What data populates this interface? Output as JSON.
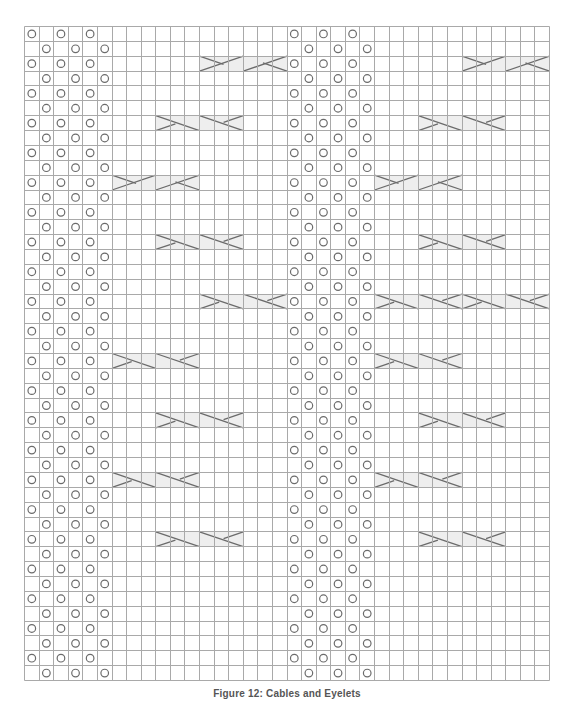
{
  "diagram": {
    "columns": 36,
    "rows": 44,
    "grid_color": "#a9a9a9",
    "symbol_color": "#6b6b6b",
    "cable_fill": "#eeeeee",
    "legend": {
      "eyelet": "yarn over (circle)",
      "cable_right": "right cross cable (3 stitches)",
      "cable_left": "left cross cable (3 stitches)"
    },
    "eyelet_panels": [
      {
        "name": "left-eyelet-panel",
        "start_col": 0,
        "width": 6
      },
      {
        "name": "center-eyelet-panel",
        "start_col": 18,
        "width": 6
      }
    ],
    "eyelet_rule": "even rows: cols +0,+2,+4; odd rows: cols +1,+3,+5",
    "cables": [
      {
        "row": 2,
        "start_col": 12,
        "count": 2,
        "type": "right"
      },
      {
        "row": 2,
        "start_col": 30,
        "count": 2,
        "type": "right"
      },
      {
        "row": 6,
        "start_col": 9,
        "count": 2,
        "type": "left"
      },
      {
        "row": 6,
        "start_col": 27,
        "count": 2,
        "type": "left"
      },
      {
        "row": 10,
        "start_col": 6,
        "count": 2,
        "type": "right"
      },
      {
        "row": 10,
        "start_col": 24,
        "count": 2,
        "type": "right"
      },
      {
        "row": 14,
        "start_col": 9,
        "count": 2,
        "type": "left"
      },
      {
        "row": 14,
        "start_col": 27,
        "count": 2,
        "type": "left"
      },
      {
        "row": 18,
        "start_col": 12,
        "count": 2,
        "type": "left"
      },
      {
        "row": 18,
        "start_col": 24,
        "count": 4,
        "type": "left"
      },
      {
        "row": 22,
        "start_col": 6,
        "count": 2,
        "type": "left"
      },
      {
        "row": 22,
        "start_col": 24,
        "count": 2,
        "type": "left"
      },
      {
        "row": 26,
        "start_col": 9,
        "count": 2,
        "type": "left"
      },
      {
        "row": 26,
        "start_col": 27,
        "count": 2,
        "type": "left"
      },
      {
        "row": 30,
        "start_col": 6,
        "count": 2,
        "type": "left"
      },
      {
        "row": 30,
        "start_col": 24,
        "count": 2,
        "type": "left"
      },
      {
        "row": 34,
        "start_col": 9,
        "count": 2,
        "type": "left"
      },
      {
        "row": 34,
        "start_col": 27,
        "count": 2,
        "type": "left"
      }
    ]
  },
  "caption": "Figure 12: Cables and Eyelets"
}
